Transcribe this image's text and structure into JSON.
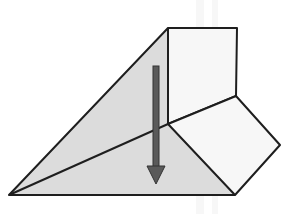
{
  "diagram": {
    "colors": {
      "background": "#ffffff",
      "shaded_face": "#dcdcdc",
      "block_face": "#f7f7f7",
      "outline": "#1e1e1e",
      "arrow": "#5a5a5a",
      "arrow_outline": "#333333"
    },
    "vertices": {
      "left_tip": [
        9,
        195
      ],
      "top_left": [
        168,
        28
      ],
      "top_right": [
        237,
        28
      ],
      "right_mid": [
        236,
        96
      ],
      "center": [
        168,
        124
      ],
      "right_tip": [
        280,
        145
      ],
      "bottom_right": [
        235,
        195
      ]
    },
    "arrow": {
      "direction": "down",
      "x": 156,
      "y_start": 66,
      "y_end": 184
    }
  }
}
